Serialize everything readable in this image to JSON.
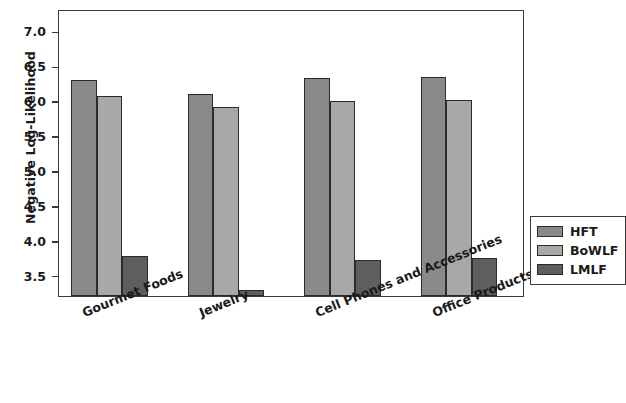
{
  "chart_data": {
    "type": "bar",
    "title": "",
    "xlabel": "",
    "ylabel": "Negative Log-Likelihood",
    "categories": [
      "Gourmet Foods",
      "Jewelry",
      "Cell Phones and Accessories",
      "Office Products"
    ],
    "series": [
      {
        "name": "HFT",
        "color": "#898989",
        "values": [
          6.31,
          6.11,
          6.33,
          6.35
        ]
      },
      {
        "name": "BoWLF",
        "color": "#a8a8a8",
        "values": [
          6.08,
          5.92,
          6.0,
          6.01
        ]
      },
      {
        "name": "LMLF",
        "color": "#5e5e5e",
        "values": [
          3.78,
          3.29,
          3.72,
          3.75
        ]
      }
    ],
    "ylim": [
      3.21,
      7.32
    ],
    "yticks": [
      3.5,
      4.0,
      4.5,
      5.0,
      5.5,
      6.0,
      6.5,
      7.0
    ],
    "ytick_labels": [
      "3.5",
      "4.0",
      "4.5",
      "5.0",
      "5.5",
      "6.0",
      "6.5",
      "7.0"
    ],
    "grid": false,
    "legend_position": "center right",
    "xtick_rotation": -22
  },
  "legend": {
    "entries": [
      {
        "label": "HFT"
      },
      {
        "label": "BoWLF"
      },
      {
        "label": "LMLF"
      }
    ]
  }
}
